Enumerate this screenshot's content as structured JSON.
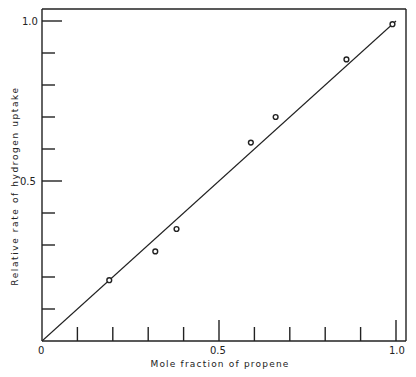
{
  "chart_data": {
    "type": "scatter",
    "title": "",
    "xlabel": "Mole fraction of propene",
    "ylabel": "Relative rate of hydrogen uptake",
    "xlim": [
      0,
      1.0
    ],
    "ylim": [
      0,
      1.0
    ],
    "x_tick_labels": [
      "0",
      "0.5",
      "1.0"
    ],
    "y_tick_labels": [
      "0.5",
      "1.0"
    ],
    "x_minor_ticks": [
      0.1,
      0.2,
      0.3,
      0.4,
      0.5,
      0.6,
      0.7,
      0.8,
      0.9,
      1.0
    ],
    "y_minor_ticks": [
      0.1,
      0.2,
      0.3,
      0.4,
      0.5,
      0.6,
      0.7,
      0.8,
      0.9,
      1.0
    ],
    "grid": false,
    "legend": null,
    "series": [
      {
        "name": "observed",
        "marker": "open-circle",
        "x": [
          0.19,
          0.32,
          0.38,
          0.59,
          0.66,
          0.86,
          0.99
        ],
        "y": [
          0.19,
          0.28,
          0.35,
          0.62,
          0.7,
          0.88,
          0.99
        ]
      },
      {
        "name": "fit line",
        "marker": "line",
        "x": [
          0,
          1.0
        ],
        "y": [
          0,
          1.0
        ]
      }
    ]
  },
  "labels": {
    "x_axis_title": "Mole fraction of propene",
    "y_axis_title": "Relative rate of hydrogen uptake",
    "origin": "0",
    "x_mid": "0.5",
    "x_max": "1.0",
    "y_mid": "0.5",
    "y_max": "1.0"
  }
}
